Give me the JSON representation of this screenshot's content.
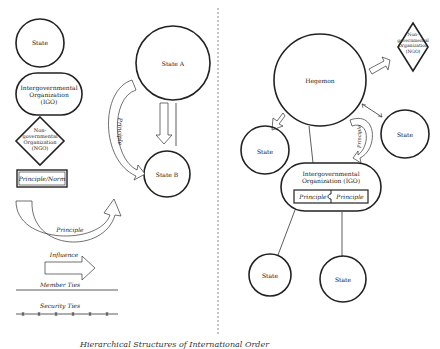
{
  "legend": {
    "state": "State",
    "igo": "Intergovernmental Organization (IGO)",
    "igo_lines": [
      "Intergovernmental",
      "Organization",
      "(IGO)"
    ],
    "ngo_lines": [
      "Non-",
      "governmental",
      "Organization",
      "(NGO)"
    ],
    "principle_norm": "Principle/Norm",
    "principle": "Principle",
    "influence": "Influence",
    "member_ties": "Member Ties",
    "security_ties": "Security Ties"
  },
  "left_diagram": {
    "state_a": "State A",
    "state_b": "State B",
    "principle": "Principle"
  },
  "right_diagram": {
    "hegemon": "Hegemon",
    "ngo_lines": [
      "Non-",
      "governmental",
      "Organization",
      "(NGO)"
    ],
    "state_right": "State",
    "state_left": "State",
    "principle": "Principle",
    "igo_lines": [
      "Intergovernmental",
      "Organization (IGO)"
    ],
    "igo_principle_left": "Principle",
    "igo_principle_right": "Principle",
    "state_bottom_left": "State",
    "state_bottom_right": "State"
  },
  "caption": "Hierarchical Structures of International Order"
}
